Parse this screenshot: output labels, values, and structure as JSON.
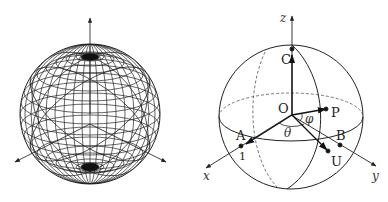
{
  "figure": {
    "left_panel": {
      "description": "Wireframe sphere with latitude/longitude mesh and three coordinate axes",
      "axes": [
        "vertical-axis",
        "left-axis",
        "right-axis"
      ]
    },
    "right_panel": {
      "description": "Bloch/unit sphere with labeled points and angles",
      "axis_labels": {
        "x": "x",
        "y": "y",
        "z": "z"
      },
      "points": {
        "origin": "O",
        "c": "C",
        "p": "P",
        "a": "A",
        "b": "B",
        "u": "U"
      },
      "angle_labels": {
        "theta": "θ",
        "phi": "φ"
      },
      "unit_label": "1"
    }
  },
  "colors": {
    "line": "#222222",
    "dashed": "#555555",
    "background": "#ffffff"
  }
}
